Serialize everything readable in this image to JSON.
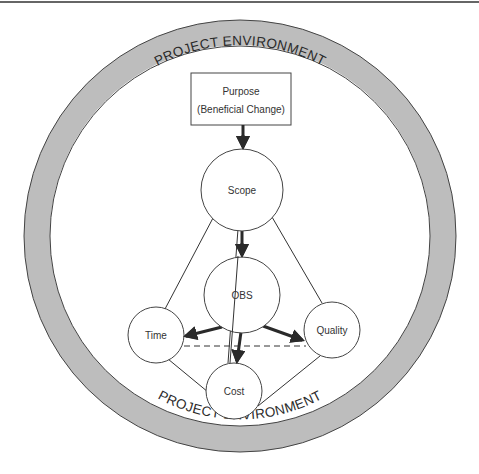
{
  "diagram": {
    "ring": {
      "top_label": "PROJECT ENVIRONMENT",
      "bottom_label": "PROJECT ENVIRONMENT",
      "fill_color": "#bdbdbd",
      "stroke_color": "#444444"
    },
    "purpose_box": {
      "line1": "Purpose",
      "line2": "(Beneficial Change)"
    },
    "nodes": {
      "scope": "Scope",
      "obs": "OBS",
      "time": "Time",
      "quality": "Quality",
      "cost": "Cost"
    },
    "edges": [
      {
        "from": "Purpose",
        "to": "Scope",
        "style": "thick-arrow"
      },
      {
        "from": "Scope",
        "to": "OBS",
        "style": "thick-arrow"
      },
      {
        "from": "OBS",
        "to": "Time",
        "style": "thick-arrow"
      },
      {
        "from": "OBS",
        "to": "Quality",
        "style": "thick-arrow"
      },
      {
        "from": "OBS",
        "to": "Cost",
        "style": "thick-arrow"
      },
      {
        "from": "Scope",
        "to": "Time",
        "style": "thin-line"
      },
      {
        "from": "Scope",
        "to": "Quality",
        "style": "thin-line"
      },
      {
        "from": "Scope",
        "to": "Cost",
        "style": "thin-line"
      },
      {
        "from": "Time",
        "to": "Cost",
        "style": "thin-line"
      },
      {
        "from": "Quality",
        "to": "Cost",
        "style": "thin-line"
      },
      {
        "from": "Time",
        "to": "Quality",
        "style": "dashed-line"
      }
    ]
  }
}
